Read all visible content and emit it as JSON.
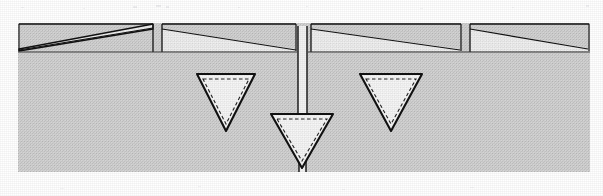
{
  "figure": {
    "style": "patent-style black-and-white technical line art, halftone screened gray fill",
    "canvas": {
      "width": 603,
      "height": 196,
      "background": "#ffffff"
    },
    "colors": {
      "page_background": "#ffffff",
      "substrate_fill": "#d2d2d2",
      "wedge_fill": "#ececec",
      "cavity_fill": "#f4f4f4",
      "stem_fill": "#ffffff",
      "line_stroke": "#111111",
      "dashed_stroke": "#222222"
    },
    "substrate": {
      "label": "substrate-body",
      "x": 18,
      "y": 23,
      "width": 572,
      "height": 149,
      "surface_line_y": 52
    },
    "wedges": [
      {
        "label": "wedge-1",
        "x_left": 19,
        "x_right": 154,
        "top_y": 24,
        "thin_end": "left",
        "tip_y": 51,
        "thick_y": 29
      },
      {
        "label": "wedge-2",
        "x_left": 162,
        "x_right": 296,
        "top_y": 24,
        "thin_end": "right",
        "tip_y": 51,
        "thick_y": 29
      },
      {
        "label": "wedge-3",
        "x_left": 311,
        "x_right": 461,
        "top_y": 24,
        "thin_end": "right",
        "tip_y": 51,
        "thick_y": 29
      },
      {
        "label": "wedge-4",
        "x_left": 470,
        "x_right": 589,
        "top_y": 24,
        "thin_end": "right",
        "tip_y": 51,
        "thick_y": 29
      }
    ],
    "gaps": [
      {
        "label": "gap-1",
        "x": 154,
        "width": 8
      },
      {
        "label": "gap-2",
        "x": 296,
        "width": 15
      },
      {
        "label": "gap-3",
        "x": 461,
        "width": 9
      }
    ],
    "channel": {
      "label": "vertical-channel-stem",
      "x_left": 297,
      "x_right": 308,
      "top_y": 26,
      "bottom_y": 126,
      "lower_x_left": 299,
      "lower_x_right": 307,
      "lower_top_y": 158,
      "lower_bottom_y": 172
    },
    "triangles": [
      {
        "label": "cavity-left",
        "apex_x": 226,
        "top_y": 74,
        "bottom_y": 131,
        "half_width": 29,
        "inner_inset": 5,
        "dashed": true
      },
      {
        "label": "cavity-center",
        "apex_x": 302,
        "top_y": 114,
        "bottom_y": 168,
        "half_width": 31,
        "inner_inset": 5,
        "dashed": true
      },
      {
        "label": "cavity-right",
        "apex_x": 391,
        "top_y": 74,
        "bottom_y": 131,
        "half_width": 31,
        "inner_inset": 5,
        "dashed": true
      }
    ],
    "annotations": {
      "top_margin_note": "faint scanner speckle artifacts above the drawing",
      "bottom_margin_note": "faint scanner speckle artifacts below the drawing"
    }
  }
}
